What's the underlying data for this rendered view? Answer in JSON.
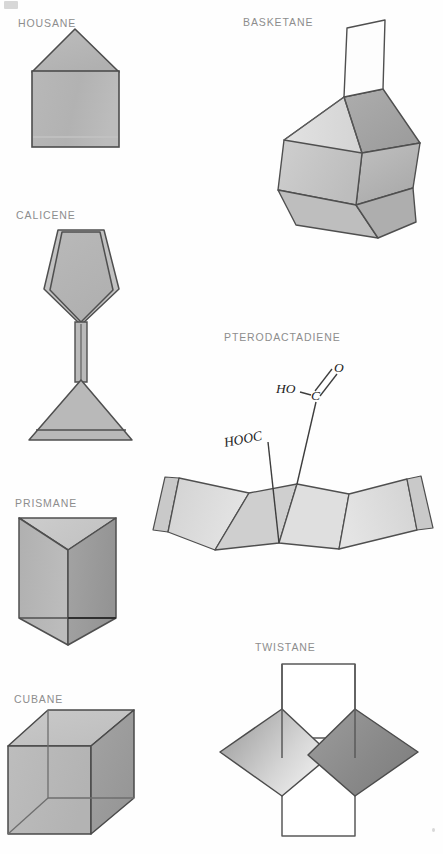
{
  "page": {
    "background_color": "#fefefe",
    "corner_mark": "28",
    "label_color": "#8d8d8d",
    "stroke_color": "#4a4a4a"
  },
  "figures": [
    {
      "id": "housane",
      "label": "HOUSANE",
      "label_x": 18,
      "label_y": 24,
      "type": "molecule-polygon",
      "description": "square with triangular roof",
      "fills": {
        "roof": "#b4b4b4",
        "body": "#b5b5b5",
        "base_strip": "#bcbcbc"
      }
    },
    {
      "id": "basketane",
      "label": "BASKETANE",
      "label_x": 243,
      "label_y": 23,
      "type": "molecule-3d",
      "description": "open basket cage with upright flap",
      "fills": {
        "inner_back": "#a6a6a6",
        "front_left": "#c2c2c2",
        "front_right": "#b3b3b3",
        "flap": "#fdfdfd",
        "rim": "#d2d2d2"
      }
    },
    {
      "id": "calicene",
      "label": "CALICENE",
      "label_x": 16,
      "label_y": 216,
      "type": "molecule-polygon",
      "description": "pentagon joined by bond to triangle",
      "fills": {
        "pentagon": "#b4b4b4",
        "triangle": "#b4b4b4",
        "edges": "#bdbdbd"
      }
    },
    {
      "id": "pterodactadiene",
      "label": "PTERODACTADIENE",
      "label_x": 224,
      "label_y": 338,
      "type": "molecule-3d",
      "description": "folded wing-like fused ring system with two carboxyl groups",
      "fills": {
        "wing_outer": "#d9d9d9",
        "wing_mid": "#d2d2d2",
        "ring_left": "#cfcfcf",
        "ring_right": "#dcdcdc"
      },
      "annotations": [
        {
          "text": "HO",
          "x": 288,
          "y": 389
        },
        {
          "text": "C",
          "x": 315,
          "y": 393
        },
        {
          "text": "O",
          "x": 337,
          "y": 367
        },
        {
          "text": "HOOC",
          "x": 250,
          "y": 443
        }
      ]
    },
    {
      "id": "prismane",
      "label": "PRISMANE",
      "label_x": 15,
      "label_y": 504,
      "type": "molecule-3d",
      "description": "triangular prism",
      "fills": {
        "top": "#c9c9c9",
        "left": "#b4b4b4",
        "right": "#9e9e9e",
        "bottom": "#b0b0b0"
      }
    },
    {
      "id": "twistane",
      "label": "TWISTANE",
      "label_x": 255,
      "label_y": 648,
      "type": "molecule-3d",
      "description": "two rhombi crossing between two vertical rectangles",
      "fills": {
        "rect": "#ffffff",
        "left_rhomb_light": "#f2f2f2",
        "left_rhomb_dark": "#9d9d9d",
        "right_rhomb_light": "#8a8a8a",
        "right_rhomb_dark": "#7e7e7e"
      }
    },
    {
      "id": "cubane",
      "label": "CUBANE",
      "label_x": 14,
      "label_y": 700,
      "type": "molecule-3d",
      "description": "wireframe cube in oblique projection",
      "fills": {
        "top": "#c4c4c4",
        "left": "#b7b7b7",
        "right": "#9b9b9b",
        "back": "#bdbdbd"
      }
    }
  ]
}
